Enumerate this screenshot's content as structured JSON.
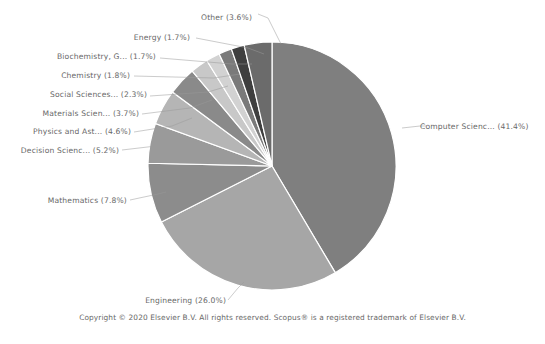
{
  "chart_data": {
    "type": "pie",
    "title": "",
    "subtitle": "",
    "xlabel": "",
    "ylabel": "",
    "legend_position": "none",
    "grid": false,
    "labels_show_percent": true,
    "categories": [
      "Computer Scienc...",
      "Engineering",
      "Mathematics",
      "Decision Scienc...",
      "Physics and Ast...",
      "Materials Scien...",
      "Social Sciences...",
      "Chemistry",
      "Biochemistry, G...",
      "Energy",
      "Other"
    ],
    "values": [
      41.4,
      26.0,
      7.8,
      5.2,
      4.6,
      3.7,
      2.3,
      1.8,
      1.7,
      1.7,
      3.6
    ],
    "colors": [
      "#7f7f7f",
      "#a6a6a6",
      "#8c8c8c",
      "#9a9a9a",
      "#b5b5b5",
      "#8a8a8a",
      "#c8c8c8",
      "#d2d2d2",
      "#7a7a7a",
      "#3f3f3f",
      "#6b6b6b"
    ],
    "slice_separator_color": "#ffffff",
    "start_angle_deg": -90,
    "direction": "clockwise",
    "center": [
      272,
      166
    ],
    "radius": 124,
    "slices": [
      {
        "label": "Computer Scienc... (41.4%)",
        "name": "Computer Scienc...",
        "percent": 41.4,
        "color": "#7f7f7f"
      },
      {
        "label": "Engineering (26.0%)",
        "name": "Engineering",
        "percent": 26.0,
        "color": "#a6a6a6"
      },
      {
        "label": "Mathematics (7.8%)",
        "name": "Mathematics",
        "percent": 7.8,
        "color": "#8c8c8c"
      },
      {
        "label": "Decision Scienc... (5.2%)",
        "name": "Decision Scienc...",
        "percent": 5.2,
        "color": "#9a9a9a"
      },
      {
        "label": "Physics and Ast... (4.6%)",
        "name": "Physics and Ast...",
        "percent": 4.6,
        "color": "#b5b5b5"
      },
      {
        "label": "Materials Scien... (3.7%)",
        "name": "Materials Scien...",
        "percent": 3.7,
        "color": "#8a8a8a"
      },
      {
        "label": "Social Sciences... (2.3%)",
        "name": "Social Sciences...",
        "percent": 2.3,
        "color": "#c8c8c8"
      },
      {
        "label": "Chemistry (1.8%)",
        "name": "Chemistry",
        "percent": 1.8,
        "color": "#d2d2d2"
      },
      {
        "label": "Biochemistry, G... (1.7%)",
        "name": "Biochemistry, G...",
        "percent": 1.7,
        "color": "#7a7a7a"
      },
      {
        "label": "Energy (1.7%)",
        "name": "Energy",
        "percent": 1.7,
        "color": "#3f3f3f"
      },
      {
        "label": "Other (3.6%)",
        "name": "Other",
        "percent": 3.6,
        "color": "#6b6b6b"
      }
    ]
  },
  "labels": {
    "other": "Other (3.6%)",
    "energy": "Energy (1.7%)",
    "biochemistry": "Biochemistry, G... (1.7%)",
    "chemistry": "Chemistry (1.8%)",
    "social_sciences": "Social Sciences... (2.3%)",
    "materials_science": "Materials Scien... (3.7%)",
    "physics_astronomy": "Physics and Ast... (4.6%)",
    "decision_sciences": "Decision Scienc... (5.2%)",
    "mathematics": "Mathematics (7.8%)",
    "engineering": "Engineering (26.0%)",
    "computer_science": "Computer Scienc... (41.4%)"
  },
  "footer": {
    "copyright": "Copyright © 2020 Elsevier B.V. All rights reserved. Scopus® is a registered trademark of Elsevier B.V."
  }
}
